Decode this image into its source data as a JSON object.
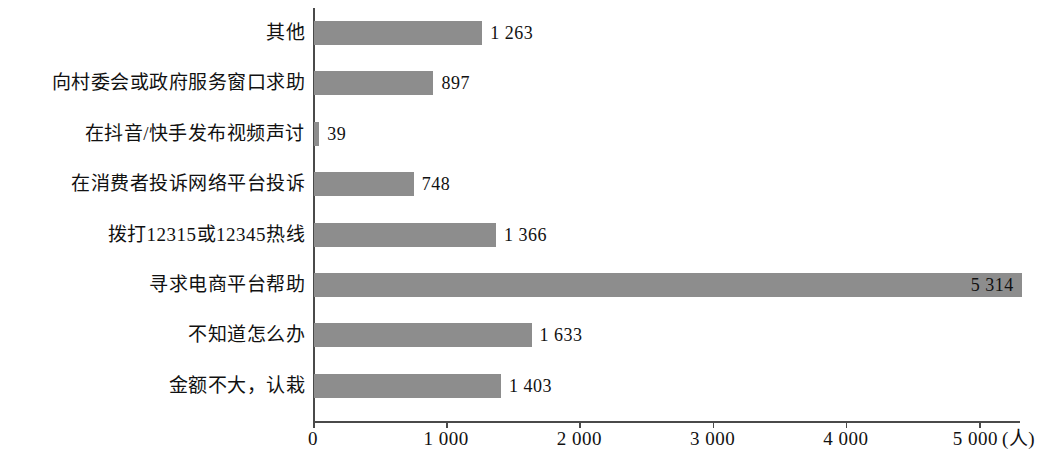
{
  "chart_data": {
    "type": "bar",
    "orientation": "horizontal",
    "title": "",
    "subtitle": "",
    "xlabel": "(人)",
    "ylabel": "",
    "xlim": [
      0,
      5314
    ],
    "axis_max_tick": 5000,
    "grid": false,
    "legend": null,
    "bar_color": "#8d8d8d",
    "axis_color": "#4a4a4a",
    "categories": [
      "其他",
      "向村委会或政府服务窗口求助",
      "在抖音/快手发布视频声讨",
      "在消费者投诉网络平台投诉",
      "拨打12315或12345热线",
      "寻求电商平台帮助",
      "不知道怎么办",
      "金额不大，认栽"
    ],
    "values": [
      1263,
      897,
      39,
      748,
      1366,
      5314,
      1633,
      1403
    ],
    "value_labels": [
      "1 263",
      "897",
      "39",
      "748",
      "1 366",
      "5 314",
      "1 633",
      "1 403"
    ],
    "label_placement": [
      "outside",
      "outside",
      "outside",
      "outside",
      "outside",
      "inside",
      "outside",
      "outside"
    ],
    "x_ticks": [
      0,
      1000,
      2000,
      3000,
      4000,
      5000
    ],
    "x_tick_labels": [
      "0",
      "1 000",
      "2 000",
      "3 000",
      "4 000",
      "5 000"
    ],
    "x_axis_unit": "(人)"
  }
}
